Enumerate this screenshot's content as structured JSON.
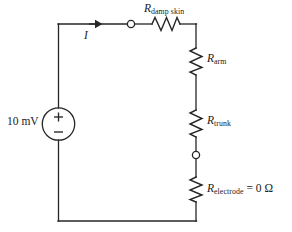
{
  "diagram": {
    "stroke_color": "#262626",
    "background_color": "#ffffff",
    "source": {
      "value_label": "10 mV",
      "polarity_plus": "+",
      "polarity_minus": "−",
      "symbol": "voltage-source-circle"
    },
    "current": {
      "label": "I",
      "direction": "right"
    },
    "components": [
      {
        "id": "damp-skin",
        "symbol": "R",
        "subscript": "damp skin",
        "value": "",
        "orientation": "horizontal"
      },
      {
        "id": "arm",
        "symbol": "R",
        "subscript": "arm",
        "value": "",
        "orientation": "vertical"
      },
      {
        "id": "trunk",
        "symbol": "R",
        "subscript": "trunk",
        "value": "",
        "orientation": "vertical"
      },
      {
        "id": "electrode",
        "symbol": "R",
        "subscript": "electrode",
        "value": " = 0 Ω",
        "orientation": "vertical"
      }
    ],
    "nodes": [
      {
        "id": "node-top",
        "shape": "open-circle"
      },
      {
        "id": "node-right",
        "shape": "open-circle"
      }
    ]
  }
}
